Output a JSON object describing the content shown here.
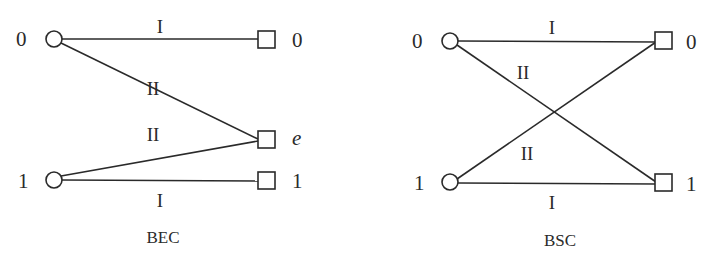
{
  "diagrams": [
    {
      "caption": "BEC",
      "inputs": [
        {
          "label": "0"
        },
        {
          "label": "1"
        }
      ],
      "outputs": [
        {
          "label": "0"
        },
        {
          "label": "e"
        },
        {
          "label": "1"
        }
      ],
      "edges": [
        {
          "from": "0",
          "to": "0",
          "label": "I"
        },
        {
          "from": "0",
          "to": "e",
          "label": "II"
        },
        {
          "from": "1",
          "to": "e",
          "label": "II"
        },
        {
          "from": "1",
          "to": "1",
          "label": "I"
        }
      ]
    },
    {
      "caption": "BSC",
      "inputs": [
        {
          "label": "0"
        },
        {
          "label": "1"
        }
      ],
      "outputs": [
        {
          "label": "0"
        },
        {
          "label": "1"
        }
      ],
      "edges": [
        {
          "from": "0",
          "to": "0",
          "label": "I"
        },
        {
          "from": "0",
          "to": "1",
          "label": "II"
        },
        {
          "from": "1",
          "to": "0",
          "label": "II"
        },
        {
          "from": "1",
          "to": "1",
          "label": "I"
        }
      ]
    }
  ],
  "colors": {
    "stroke": "#2a2a2a",
    "background": "#ffffff"
  }
}
